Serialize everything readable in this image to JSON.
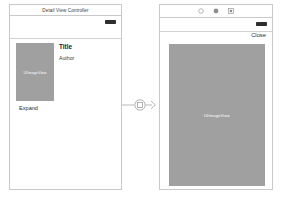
{
  "canvas": {
    "background_color": "#ffffff",
    "placeholder_fill": "#a0a0a0",
    "outline_color": "#c9c9c9"
  },
  "detail_scene": {
    "name": "Detail View Controller scene",
    "title_bar": {
      "title": "Detail View Controller"
    },
    "status_bar": {
      "battery_icon": "battery-icon"
    },
    "image_view": {
      "icon": "image-view-icon",
      "placeholder_label": "UIImageView"
    },
    "title_label": "Title",
    "author_label": "Author",
    "expand_button": "Expand"
  },
  "segue": {
    "name": "modal-segue",
    "connector_icon": "segue-connector-icon",
    "arrow_icon": "arrow-right-icon"
  },
  "modal_scene": {
    "name": "Image View Controller scene",
    "toolbar": {
      "items": [
        {
          "icon": "circle-outline-icon",
          "label": ""
        },
        {
          "icon": "circle-filled-icon",
          "label": ""
        },
        {
          "icon": "square-grid-icon",
          "label": ""
        }
      ]
    },
    "status_bar": {
      "battery_icon": "battery-icon"
    },
    "close_button": "Close",
    "image_view": {
      "icon": "image-view-icon",
      "placeholder_label": "UIImageView"
    }
  }
}
